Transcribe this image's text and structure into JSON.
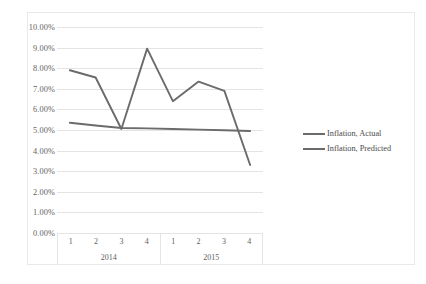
{
  "chart_data": {
    "type": "line",
    "title": "",
    "xlabel": "",
    "ylabel": "",
    "ylim": [
      0,
      10
    ],
    "ytick_labels": [
      "10.00%",
      "9.00%",
      "8.00%",
      "7.00%",
      "6.00%",
      "5.00%",
      "4.00%",
      "3.00%",
      "2.00%",
      "1.00%",
      "0.00%"
    ],
    "ytick_values": [
      10,
      9,
      8,
      7,
      6,
      5,
      4,
      3,
      2,
      1,
      0
    ],
    "grid": true,
    "legend_position": "right",
    "x_groups": [
      {
        "label": "2014",
        "categories": [
          "1",
          "2",
          "3",
          "4"
        ]
      },
      {
        "label": "2015",
        "categories": [
          "1",
          "2",
          "3",
          "4"
        ]
      }
    ],
    "categories": [
      "1",
      "2",
      "3",
      "4",
      "1",
      "2",
      "3",
      "4"
    ],
    "series": [
      {
        "name": "Inflation, Actual",
        "color": "#6b6b6b",
        "values": [
          7.9,
          7.55,
          5.05,
          8.95,
          6.4,
          7.35,
          6.9,
          3.3
        ]
      },
      {
        "name": "Inflation, Predicted",
        "color": "#6b6b6b",
        "values": [
          5.35,
          5.22,
          5.1,
          5.08,
          5.05,
          5.02,
          4.99,
          4.95
        ]
      }
    ]
  },
  "legend": {
    "items": [
      {
        "label": "Inflation, Actual"
      },
      {
        "label": "Inflation, Predicted"
      }
    ]
  }
}
